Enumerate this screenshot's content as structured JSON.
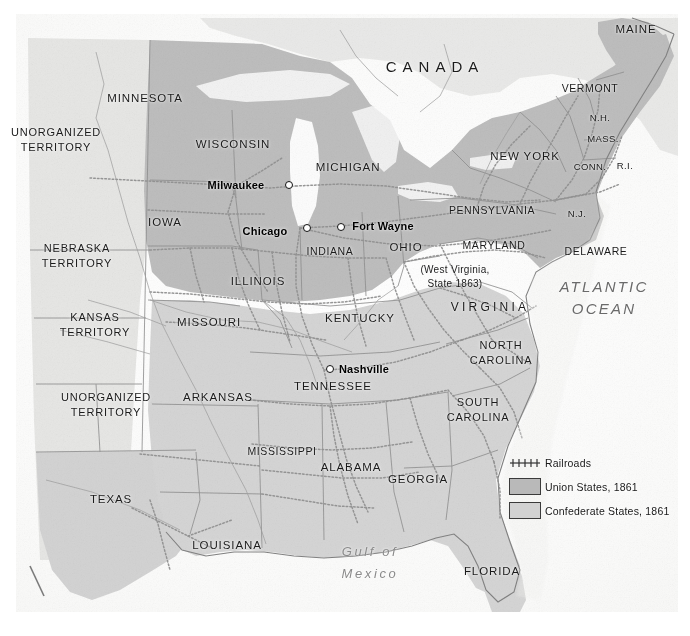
{
  "map": {
    "title": "Civil War era United States railroad map, 1861",
    "country_labels": [
      {
        "name": "canada",
        "text": "CANADA",
        "x": 435,
        "y": 66
      }
    ],
    "water_labels": [
      {
        "name": "atlantic-ocean",
        "text": "ATLANTIC\nOCEAN",
        "x": 604,
        "y": 298
      },
      {
        "name": "gulf-of-mexico",
        "text": "Gulf of\nMexico",
        "x": 370,
        "y": 563
      }
    ],
    "states": [
      {
        "name": "minnesota",
        "text": "MINNESOTA",
        "x": 145,
        "y": 98
      },
      {
        "name": "wisconsin",
        "text": "WISCONSIN",
        "x": 233,
        "y": 144
      },
      {
        "name": "michigan",
        "text": "MICHIGAN",
        "x": 348,
        "y": 167
      },
      {
        "name": "iowa",
        "text": "IOWA",
        "x": 165,
        "y": 222
      },
      {
        "name": "illinois",
        "text": "ILLINOIS",
        "x": 258,
        "y": 281
      },
      {
        "name": "indiana",
        "text": "INDIANA",
        "x": 330,
        "y": 251
      },
      {
        "name": "ohio",
        "text": "OHIO",
        "x": 406,
        "y": 247
      },
      {
        "name": "missouri",
        "text": "MISSOURI",
        "x": 209,
        "y": 322
      },
      {
        "name": "kentucky",
        "text": "KENTUCKY",
        "x": 360,
        "y": 318
      },
      {
        "name": "tennessee",
        "text": "TENNESSEE",
        "x": 333,
        "y": 386
      },
      {
        "name": "arkansas",
        "text": "ARKANSAS",
        "x": 218,
        "y": 397
      },
      {
        "name": "mississippi",
        "text": "MISSISSIPPI",
        "x": 282,
        "y": 451
      },
      {
        "name": "alabama",
        "text": "ALABAMA",
        "x": 351,
        "y": 467
      },
      {
        "name": "georgia",
        "text": "GEORGIA",
        "x": 418,
        "y": 479
      },
      {
        "name": "louisiana",
        "text": "LOUISIANA",
        "x": 227,
        "y": 545
      },
      {
        "name": "florida",
        "text": "FLORIDA",
        "x": 492,
        "y": 571
      },
      {
        "name": "texas",
        "text": "TEXAS",
        "x": 111,
        "y": 499
      },
      {
        "name": "pennsylvania",
        "text": "PENNSYLVANIA",
        "x": 492,
        "y": 210
      },
      {
        "name": "new-york",
        "text": "NEW YORK",
        "x": 525,
        "y": 156
      },
      {
        "name": "maryland",
        "text": "MARYLAND",
        "x": 494,
        "y": 245
      },
      {
        "name": "delaware",
        "text": "DELAWARE",
        "x": 596,
        "y": 251
      },
      {
        "name": "north-carolina",
        "text": "NORTH\nCAROLINA",
        "x": 501,
        "y": 353
      },
      {
        "name": "south-carolina",
        "text": "SOUTH\nCAROLINA",
        "x": 478,
        "y": 410
      },
      {
        "name": "maine",
        "text": "MAINE",
        "x": 636,
        "y": 29
      },
      {
        "name": "vermont",
        "text": "VERMONT",
        "x": 590,
        "y": 88
      },
      {
        "name": "new-hampshire",
        "text": "N.H.",
        "x": 600,
        "y": 117
      },
      {
        "name": "massachusetts",
        "text": "MASS.",
        "x": 603,
        "y": 138
      },
      {
        "name": "connecticut",
        "text": "CONN.",
        "x": 590,
        "y": 166
      },
      {
        "name": "rhode-island",
        "text": "R.I.",
        "x": 625,
        "y": 165
      },
      {
        "name": "new-jersey",
        "text": "N.J.",
        "x": 577,
        "y": 213
      }
    ],
    "virginia": {
      "name": "virginia",
      "text": "VIRGINIA",
      "x": 490,
      "y": 307
    },
    "west_virginia_note": {
      "name": "west-virginia-note",
      "text": "(West Virginia,\nState 1863)",
      "x": 455,
      "y": 277
    },
    "territories": [
      {
        "name": "unorganized-territory-north",
        "text": "UNORGANIZED\nTERRITORY",
        "x": 56,
        "y": 140
      },
      {
        "name": "nebraska-territory",
        "text": "NEBRASKA\nTERRITORY",
        "x": 77,
        "y": 256
      },
      {
        "name": "kansas-territory",
        "text": "KANSAS\nTERRITORY",
        "x": 95,
        "y": 325
      },
      {
        "name": "unorganized-territory-south",
        "text": "UNORGANIZED\nTERRITORY",
        "x": 106,
        "y": 405
      }
    ],
    "cities": [
      {
        "name": "milwaukee",
        "text": "Milwaukee",
        "tx": 236,
        "ty": 185,
        "dx": 289,
        "dy": 185
      },
      {
        "name": "chicago",
        "text": "Chicago",
        "tx": 265,
        "ty": 231,
        "dx": 307,
        "dy": 228
      },
      {
        "name": "fort-wayne",
        "text": "Fort Wayne",
        "tx": 383,
        "ty": 226,
        "dx": 341,
        "dy": 227
      },
      {
        "name": "nashville",
        "text": "Nashville",
        "tx": 364,
        "ty": 369,
        "dx": 330,
        "dy": 369
      }
    ]
  },
  "legend": {
    "items": [
      {
        "name": "legend-railroads",
        "symbol": "railroad-hatch-icon",
        "label": "Railroads"
      },
      {
        "name": "legend-union",
        "symbol": "union-swatch-icon",
        "label": "Union States, 1861",
        "color": "#b9b9b9"
      },
      {
        "name": "legend-confederate",
        "symbol": "confederate-swatch-icon",
        "label": "Confederate States, 1861",
        "color": "#d2d2d2"
      }
    ]
  },
  "colors": {
    "union_fill": "#b9b9b9",
    "confederate_fill": "#d2d2d2",
    "territory_fill": "#e4e4e2",
    "ocean": "#fbfbfa",
    "border_line": "#8d8d8d",
    "railroad": "#9a9a9a",
    "text": "#1b1b1b"
  }
}
